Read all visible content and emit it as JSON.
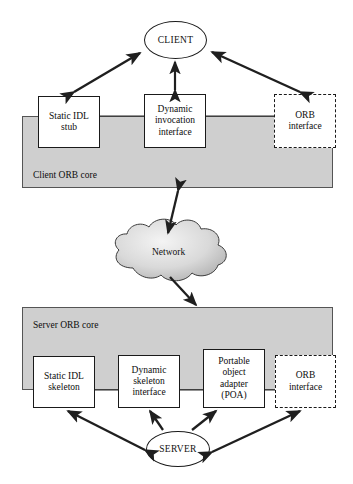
{
  "figure": {
    "background_color": "#ffffff",
    "band_fill_color": "#cfcfcf",
    "stroke_color": "#1a1a1a"
  },
  "client_side": {
    "actor": {
      "label": "CLIENT",
      "shape": "ellipse"
    },
    "band_label": "Client ORB core",
    "components": [
      {
        "label": "Static IDL\nstub",
        "line1": "Static IDL",
        "line2": "stub",
        "style": "solid"
      },
      {
        "label": "Dynamic invocation interface",
        "line1": "Dynamic",
        "line2": "invocation",
        "line3": "interface",
        "style": "solid"
      },
      {
        "label": "ORB interface",
        "line1": "ORB",
        "line2": "interface",
        "style": "dashed"
      }
    ]
  },
  "network": {
    "label": "Network",
    "shape": "cloud"
  },
  "server_side": {
    "actor": {
      "label": "SERVER",
      "shape": "ellipse"
    },
    "band_label": "Server ORB core",
    "components": [
      {
        "label": "Static IDL skeleton",
        "line1": "Static IDL",
        "line2": "skeleton",
        "style": "solid"
      },
      {
        "label": "Dynamic skeleton interface",
        "line1": "Dynamic",
        "line2": "skeleton",
        "line3": "interface",
        "style": "solid"
      },
      {
        "label": "Portable object adapter (POA)",
        "line1": "Portable",
        "line2": "object",
        "line3": "adapter",
        "line4": "(POA)",
        "style": "solid"
      },
      {
        "label": "ORB interface",
        "line1": "ORB",
        "line2": "interface",
        "style": "dashed"
      }
    ]
  },
  "connectors": [
    {
      "from": "Static IDL stub",
      "to": "CLIENT",
      "heads": "double"
    },
    {
      "from": "Dynamic invocation interface",
      "to": "CLIENT",
      "heads": "double"
    },
    {
      "from": "ORB interface (client)",
      "to": "CLIENT",
      "heads": "double"
    },
    {
      "from": "Client ORB core",
      "to": "Network",
      "heads": "double"
    },
    {
      "from": "Network",
      "to": "Server ORB core",
      "heads": "single"
    },
    {
      "from": "Static IDL skeleton",
      "to": "SERVER",
      "heads": "double"
    },
    {
      "from": "SERVER",
      "to": "Dynamic skeleton interface",
      "heads": "single"
    },
    {
      "from": "SERVER",
      "to": "Portable object adapter (POA)",
      "heads": "double"
    },
    {
      "from": "SERVER",
      "to": "ORB interface (server)",
      "heads": "double"
    }
  ]
}
